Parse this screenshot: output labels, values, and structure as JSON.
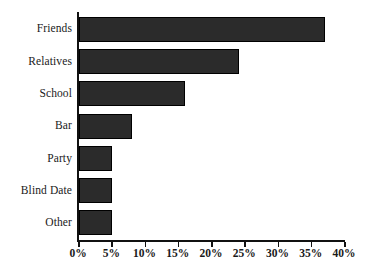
{
  "chart_data": {
    "type": "bar",
    "orientation": "horizontal",
    "title": "",
    "subtitle": "",
    "xlabel": "",
    "ylabel": "",
    "categories": [
      "Friends",
      "Relatives",
      "School",
      "Bar",
      "Party",
      "Blind Date",
      "Other"
    ],
    "values": [
      37,
      24,
      16,
      8,
      5,
      5,
      5
    ],
    "xlim": [
      0,
      40
    ],
    "xticks": [
      0,
      5,
      10,
      15,
      20,
      25,
      30,
      35,
      40
    ],
    "xtick_labels": [
      "0%",
      "5%",
      "10%",
      "15%",
      "20%",
      "25%",
      "30%",
      "35%",
      "40%"
    ],
    "grid": false,
    "legend": false,
    "legend_position": "none",
    "bar_color": "#2b2b2b",
    "bar_edge_color": "#000000",
    "axis_color": "#111111",
    "background_color": "#ffffff",
    "value_unit": "%"
  }
}
